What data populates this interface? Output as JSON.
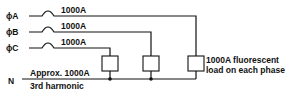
{
  "diagram": {
    "type": "electrical-circuit",
    "phases": [
      {
        "label": "ϕA",
        "current": "1000A"
      },
      {
        "label": "ϕB",
        "current": "1000A"
      },
      {
        "label": "ϕC",
        "current": "1000A"
      }
    ],
    "neutral": {
      "label": "N",
      "current": "Approx. 1000A",
      "note": "3rd harmonic"
    },
    "load_note_line1": "1000A fluorescent",
    "load_note_line2": "load on each phase",
    "colors": {
      "line": "#111111",
      "background": "#ffffff"
    }
  }
}
